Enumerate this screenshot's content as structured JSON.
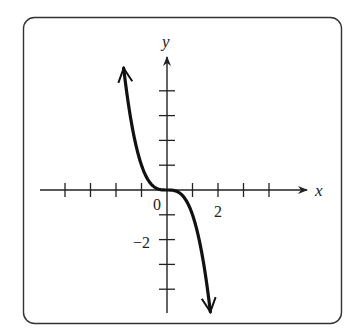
{
  "chart_data": {
    "type": "line",
    "title": "",
    "function": "y = -x^3",
    "xlabel": "x",
    "ylabel": "y",
    "xlim": [
      -4,
      4
    ],
    "ylim": [
      -4,
      4
    ],
    "x_ticks": [
      -4,
      -3,
      -2,
      -1,
      1,
      2,
      3,
      4
    ],
    "y_ticks": [
      -4,
      -3,
      -2,
      -1,
      1,
      2,
      3,
      4
    ],
    "tick_labels": [
      {
        "axis": "origin",
        "value": 0,
        "text": "0"
      },
      {
        "axis": "x",
        "value": 2,
        "text": "2"
      },
      {
        "axis": "y",
        "value": -2,
        "text": "−2"
      }
    ],
    "series": [
      {
        "name": "curve",
        "x_range": [
          -1.7,
          1.7
        ],
        "arrows": "both",
        "points": [
          [
            -1.7,
            4.913
          ],
          [
            -1.5,
            3.375
          ],
          [
            -1,
            1
          ],
          [
            -0.5,
            0.125
          ],
          [
            0,
            0
          ],
          [
            0.5,
            -0.125
          ],
          [
            1,
            -1
          ],
          [
            1.5,
            -3.375
          ],
          [
            1.7,
            -4.913
          ]
        ]
      }
    ],
    "grid": false,
    "colors": {
      "line": "#111111",
      "frame": "#333333"
    }
  }
}
